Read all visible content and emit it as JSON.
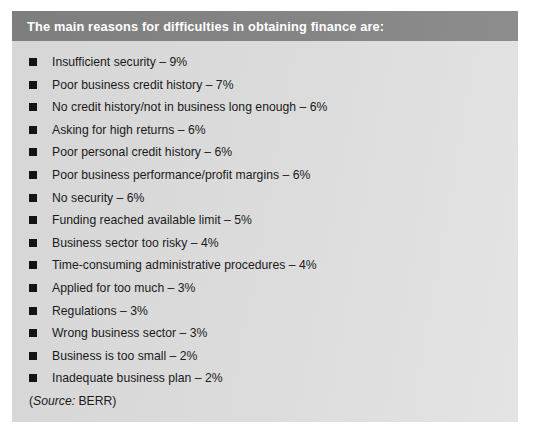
{
  "panel": {
    "header_title": "The main reasons for difficulties in obtaining finance are:",
    "header_bg": "#838383",
    "body_bg": "#dcdcdc",
    "bullet_color": "#141414",
    "header_text_color": "#ffffff",
    "body_text_color": "#1a1a1a",
    "items": [
      {
        "label": "Insufficient security – 9%",
        "reason": "Insufficient security",
        "value": 9
      },
      {
        "label": "Poor business credit history – 7%",
        "reason": "Poor business credit history",
        "value": 7
      },
      {
        "label": "No credit history/not in business long enough – 6%",
        "reason": "No credit history/not in business long enough",
        "value": 6
      },
      {
        "label": "Asking for high returns – 6%",
        "reason": "Asking for high returns",
        "value": 6
      },
      {
        "label": "Poor personal credit history – 6%",
        "reason": "Poor personal credit history",
        "value": 6
      },
      {
        "label": "Poor business performance/profit margins – 6%",
        "reason": "Poor business performance/profit margins",
        "value": 6
      },
      {
        "label": "No security – 6%",
        "reason": "No security",
        "value": 6
      },
      {
        "label": "Funding reached available limit – 5%",
        "reason": "Funding reached available limit",
        "value": 5
      },
      {
        "label": "Business sector too risky – 4%",
        "reason": "Business sector too risky",
        "value": 4
      },
      {
        "label": "Time-consuming administrative procedures – 4%",
        "reason": "Time-consuming administrative procedures",
        "value": 4
      },
      {
        "label": "Applied for too much – 3%",
        "reason": "Applied for too much",
        "value": 3
      },
      {
        "label": "Regulations – 3%",
        "reason": "Regulations",
        "value": 3
      },
      {
        "label": "Wrong business sector – 3%",
        "reason": "Wrong business sector",
        "value": 3
      },
      {
        "label": "Business is too small – 2%",
        "reason": "Business is too small",
        "value": 2
      },
      {
        "label": "Inadequate business plan – 2%",
        "reason": "Inadequate business plan",
        "value": 2
      }
    ],
    "source": {
      "open_paren": "(",
      "label": "Source:",
      "name": " BERR",
      "close_paren": ")"
    }
  }
}
